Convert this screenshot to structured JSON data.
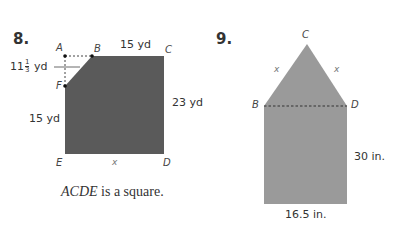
{
  "problems": [
    {
      "number": "8.",
      "points": {
        "A": "A",
        "B": "B",
        "C": "C",
        "D": "D",
        "E": "E",
        "F": "F"
      },
      "measures": {
        "BC": "15 yd",
        "AF_whole": "11",
        "AF_num": "1",
        "AF_den": "3",
        "AF_unit": "yd",
        "CD": "23 yd",
        "FE": "15 yd",
        "ED": "x"
      },
      "caption_italic": "ACDE",
      "caption_rest": " is a square.",
      "fill_color": "#5a5a5a"
    },
    {
      "number": "9.",
      "points": {
        "B": "B",
        "C": "C",
        "D": "D"
      },
      "measures": {
        "BC": "x",
        "CD": "x",
        "height": "30 in.",
        "width": "16.5 in."
      },
      "fill_color": "#9a9a9a"
    }
  ]
}
